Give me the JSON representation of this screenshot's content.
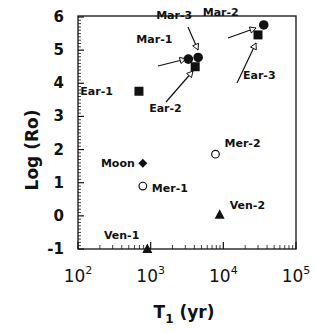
{
  "chart_data": {
    "type": "scatter",
    "title": "",
    "xlabel": "T1 (yr)",
    "xlabel_main": "T",
    "xlabel_sub": "1",
    "xlabel_rest": " (yr)",
    "ylabel": "Log (Ro)",
    "xscale": "log",
    "xlim": [
      100,
      100000
    ],
    "ylim": [
      -1,
      6
    ],
    "grid": false,
    "legend": "none",
    "x_ticks": [
      {
        "base": "10",
        "exp": "2",
        "value": 100
      },
      {
        "base": "10",
        "exp": "3",
        "value": 1000
      },
      {
        "base": "10",
        "exp": "4",
        "value": 10000
      },
      {
        "base": "10",
        "exp": "5",
        "value": 100000
      }
    ],
    "y_ticks": [
      "-1",
      "0",
      "1",
      "2",
      "3",
      "4",
      "5",
      "6"
    ],
    "points": [
      {
        "label": "Ear-1",
        "marker": "filled-square",
        "x": 690,
        "y": 3.76
      },
      {
        "label": "Ear-2",
        "marker": "filled-square",
        "x": 4100,
        "y": 4.5
      },
      {
        "label": "Ear-3",
        "marker": "filled-square",
        "x": 30000,
        "y": 5.46
      },
      {
        "label": "Mar-1",
        "marker": "filled-circle",
        "x": 3300,
        "y": 4.73
      },
      {
        "label": "Mar-2",
        "marker": "filled-circle",
        "x": 36000,
        "y": 5.76
      },
      {
        "label": "Mar-3",
        "marker": "filled-circle",
        "x": 4500,
        "y": 4.78
      },
      {
        "label": "Moon",
        "marker": "filled-diamond",
        "x": 780,
        "y": 1.59
      },
      {
        "label": "Mer-1",
        "marker": "open-circle",
        "x": 780,
        "y": 0.9
      },
      {
        "label": "Mer-2",
        "marker": "open-circle",
        "x": 7800,
        "y": 1.86
      },
      {
        "label": "Ven-1",
        "marker": "filled-triangle",
        "x": 900,
        "y": -1.0
      },
      {
        "label": "Ven-2",
        "marker": "filled-triangle",
        "x": 8900,
        "y": 0.03
      }
    ],
    "annotations": [
      {
        "text": "Mar-3",
        "arrow_to": "Mar-3"
      },
      {
        "text": "Mar-2",
        "arrow_to": "Mar-2"
      },
      {
        "text": "Mar-1",
        "arrow_to": "Mar-1"
      },
      {
        "text": "Ear-2",
        "arrow_to": "Ear-2"
      },
      {
        "text": "Ear-3",
        "arrow_to": "Ear-3"
      }
    ]
  }
}
